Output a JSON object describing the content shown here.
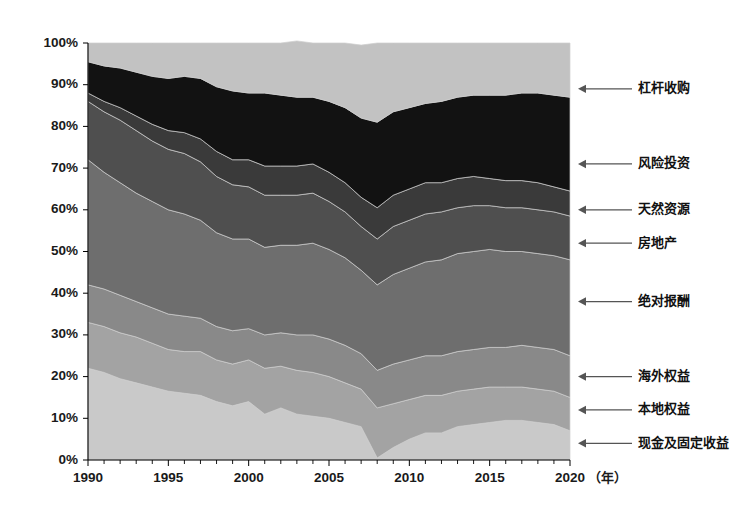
{
  "chart_data": {
    "type": "area",
    "stacked": true,
    "normalized": true,
    "title": "",
    "subtitle": "",
    "xlabel": "",
    "ylabel": "",
    "x_unit": "（年）",
    "xlim": [
      1990,
      2020
    ],
    "ylim": [
      0,
      100
    ],
    "grid": false,
    "legend_position": "right-annotations",
    "x": [
      1990,
      1991,
      1992,
      1993,
      1994,
      1995,
      1996,
      1997,
      1998,
      1999,
      2000,
      2001,
      2002,
      2003,
      2004,
      2005,
      2006,
      2007,
      2008,
      2009,
      2010,
      2011,
      2012,
      2013,
      2014,
      2015,
      2016,
      2017,
      2018,
      2019,
      2020
    ],
    "xticks": [
      1990,
      1995,
      2000,
      2005,
      2010,
      2015,
      2020
    ],
    "xtick_labels": [
      "1990",
      "1995",
      "2000",
      "2005",
      "2010",
      "2015",
      "2020"
    ],
    "yticks": [
      0,
      10,
      20,
      30,
      40,
      50,
      60,
      70,
      80,
      90,
      100
    ],
    "ytick_labels": [
      "0%",
      "10%",
      "20%",
      "30%",
      "40%",
      "50%",
      "60%",
      "70%",
      "80%",
      "90%",
      "100%"
    ],
    "series": [
      {
        "name": "现金及固定收益",
        "color": "#c9c9c9",
        "label_y_pct": 4,
        "values": [
          22.0,
          21.0,
          19.5,
          18.5,
          17.5,
          16.5,
          16.0,
          15.5,
          14.0,
          13.0,
          14.0,
          11.0,
          12.5,
          11.0,
          10.5,
          10.0,
          9.0,
          8.0,
          0.5,
          3.0,
          5.0,
          6.5,
          6.5,
          8.0,
          8.5,
          9.0,
          9.5,
          9.5,
          9.0,
          8.5,
          7.0
        ]
      },
      {
        "name": "本地权益",
        "color": "#a3a3a3",
        "label_y_pct": 12,
        "values": [
          11.0,
          11.0,
          11.0,
          11.0,
          10.5,
          10.0,
          10.0,
          10.5,
          10.0,
          10.0,
          10.0,
          11.0,
          10.0,
          10.5,
          10.5,
          10.0,
          9.5,
          9.0,
          12.0,
          10.5,
          9.5,
          9.0,
          9.0,
          8.5,
          8.5,
          8.5,
          8.0,
          8.0,
          8.0,
          8.0,
          8.0
        ]
      },
      {
        "name": "海外权益",
        "color": "#898989",
        "label_y_pct": 20,
        "values": [
          9.0,
          9.0,
          9.0,
          8.5,
          8.5,
          8.5,
          8.5,
          8.0,
          8.0,
          8.0,
          7.5,
          8.0,
          8.0,
          8.5,
          9.0,
          9.0,
          9.0,
          8.5,
          9.0,
          9.5,
          9.5,
          9.5,
          9.5,
          9.5,
          9.5,
          9.5,
          9.5,
          10.0,
          10.0,
          10.0,
          10.0
        ]
      },
      {
        "name": "绝对报酬",
        "color": "#6e6e6e",
        "label_y_pct": 38,
        "values": [
          30.0,
          28.0,
          27.0,
          26.0,
          25.5,
          25.0,
          24.5,
          23.5,
          22.5,
          22.0,
          21.5,
          21.0,
          21.0,
          21.5,
          22.0,
          21.5,
          21.0,
          20.0,
          20.5,
          21.5,
          22.0,
          22.5,
          23.0,
          23.5,
          23.5,
          23.5,
          23.0,
          22.5,
          22.5,
          22.5,
          23.0
        ]
      },
      {
        "name": "房地产",
        "color": "#4f4f4f",
        "label_y_pct": 52,
        "values": [
          14.0,
          14.5,
          15.0,
          15.0,
          14.5,
          14.5,
          14.5,
          14.0,
          13.5,
          13.0,
          12.5,
          12.5,
          12.0,
          12.0,
          12.0,
          11.5,
          11.0,
          10.5,
          11.0,
          11.5,
          11.5,
          11.5,
          11.5,
          11.0,
          11.0,
          10.5,
          10.5,
          10.5,
          10.5,
          10.5,
          10.5
        ]
      },
      {
        "name": "天然资源",
        "color": "#3a3a3a",
        "label_y_pct": 60,
        "values": [
          2.0,
          2.5,
          3.0,
          3.5,
          4.0,
          4.5,
          5.0,
          5.5,
          6.0,
          6.0,
          6.5,
          7.0,
          7.0,
          7.0,
          7.0,
          7.0,
          7.0,
          7.0,
          7.5,
          7.5,
          7.5,
          7.5,
          7.0,
          7.0,
          7.0,
          6.5,
          6.5,
          6.5,
          6.5,
          6.0,
          6.0
        ]
      },
      {
        "name": "风险投资",
        "color": "#121212",
        "label_y_pct": 71,
        "values": [
          7.5,
          8.5,
          9.5,
          10.5,
          11.5,
          12.5,
          13.5,
          14.5,
          15.5,
          16.5,
          16.0,
          17.5,
          17.0,
          16.5,
          16.0,
          17.0,
          18.0,
          19.0,
          20.5,
          20.0,
          19.5,
          19.0,
          19.5,
          19.5,
          19.5,
          20.0,
          20.5,
          21.0,
          21.5,
          22.0,
          22.5
        ]
      },
      {
        "name": "杠杆收购",
        "color": "#c2c2c2",
        "label_y_pct": 89,
        "values": [
          4.5,
          5.5,
          6.0,
          7.0,
          8.0,
          8.5,
          8.0,
          8.5,
          10.5,
          11.5,
          12.0,
          12.0,
          12.5,
          13.5,
          13.0,
          14.0,
          15.5,
          17.5,
          19.0,
          16.5,
          15.5,
          14.5,
          14.0,
          13.0,
          12.5,
          12.5,
          12.5,
          12.0,
          12.0,
          12.5,
          13.0
        ]
      }
    ]
  },
  "axis": {
    "y_tick_labels": [
      "100%",
      "90%",
      "80%",
      "70%",
      "60%",
      "50%",
      "40%",
      "30%",
      "20%",
      "10%",
      "0%"
    ],
    "y_tick_values": [
      100,
      90,
      80,
      70,
      60,
      50,
      40,
      30,
      20,
      10,
      0
    ],
    "x_tick_labels": [
      "1990",
      "1995",
      "2000",
      "2005",
      "2010",
      "2015",
      "2020"
    ],
    "x_tick_values": [
      1990,
      1995,
      2000,
      2005,
      2010,
      2015,
      2020
    ],
    "x_unit_label": "（年）"
  },
  "annotations": [
    {
      "name": "杠杆收购",
      "y_pct": 89
    },
    {
      "name": "风险投资",
      "y_pct": 71
    },
    {
      "name": "天然资源",
      "y_pct": 60
    },
    {
      "name": "房地产",
      "y_pct": 52
    },
    {
      "name": "绝对报酬",
      "y_pct": 38
    },
    {
      "name": "海外权益",
      "y_pct": 20
    },
    {
      "name": "本地权益",
      "y_pct": 12
    },
    {
      "name": "现金及固定收益",
      "y_pct": 4
    }
  ],
  "colors": {
    "background": "#ffffff",
    "axis": "#000000",
    "leader": "#555555",
    "text": "#111111"
  }
}
